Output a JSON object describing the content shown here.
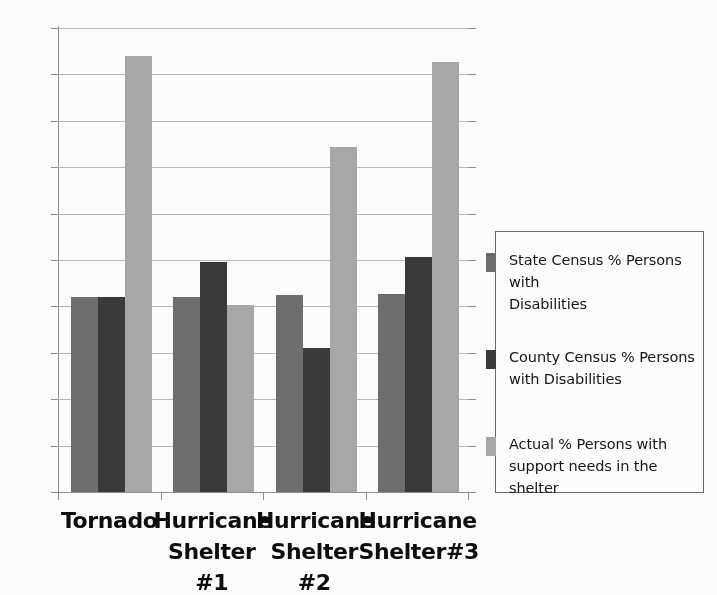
{
  "chart_data": {
    "type": "bar",
    "title": "",
    "subtitle": "",
    "xlabel": "",
    "ylabel": "",
    "categories": [
      "Tornado",
      "Hurricane Shelter #1",
      "Hurricane Shelter #2",
      "Hurricane Shelter#3"
    ],
    "category_lines": [
      [
        "Tornado"
      ],
      [
        "Hurricane",
        "Shelter #1"
      ],
      [
        "Hurricane",
        "Shelter #2"
      ],
      [
        "Hurricane",
        "Shelter#3"
      ]
    ],
    "series": [
      {
        "name": "State Census % Persons with Disabilities",
        "name_lines": [
          "State Census % Persons with",
          "Disabilities"
        ],
        "color": "#6e6e6e",
        "values": [
          21.0,
          21.0,
          21.2,
          21.3
        ]
      },
      {
        "name": "County Census % Persons with Disabilities",
        "name_lines": [
          "County Census % Persons",
          "with Disabilities"
        ],
        "color": "#3a3a3a",
        "values": [
          21.0,
          24.8,
          15.5,
          25.3
        ]
      },
      {
        "name": "Actual % Persons with support needs in the shelter",
        "name_lines": [
          "Actual % Persons with",
          "support needs in the shelter"
        ],
        "color": "#a8a8a8",
        "values": [
          47.0,
          20.1,
          37.2,
          46.3
        ]
      }
    ],
    "ylim": [
      0,
      50
    ],
    "ystep": 5,
    "yticks": [
      0,
      5,
      10,
      15,
      20,
      25,
      30,
      35,
      40,
      45,
      50
    ],
    "ytick_labels": [
      "0",
      "5",
      "10",
      "15",
      "20",
      "25",
      "30",
      "35",
      "40",
      "45",
      "50"
    ],
    "grid": true,
    "grid_axis": "y",
    "legend_position": "right",
    "legend_border_color": "#6b6b6b",
    "axis_color": "#8e8e8e",
    "gridline_color": "#b9b9b9",
    "background_color": "#fdfdfd"
  }
}
